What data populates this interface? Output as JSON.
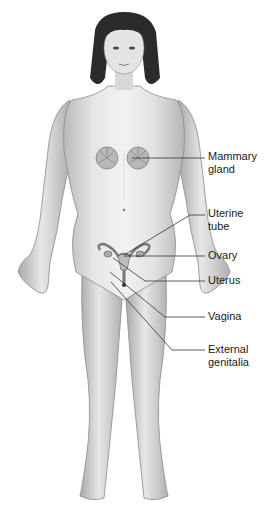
{
  "figure": {
    "colors": {
      "skin_light": "#ededed",
      "skin_mid": "#c9c9c9",
      "skin_dark": "#8a8a8a",
      "hair": "#2b2b2b",
      "organ": "#9a9a9a",
      "leader_line": "#333333",
      "text": "#1a1a1a",
      "background": "#ffffff"
    }
  },
  "labels": [
    {
      "id": "mammary-gland",
      "text": "Mammary\ngland",
      "top": 150,
      "line_y": 158,
      "target_x": 132,
      "target_y": 158
    },
    {
      "id": "uterine-tube",
      "text": "Uterine\ntube",
      "top": 207,
      "line_y": 215,
      "target_x": 122,
      "target_y": 255
    },
    {
      "id": "ovary",
      "text": "Ovary",
      "top": 248,
      "line_y": 256,
      "target_x": 124,
      "target_y": 256
    },
    {
      "id": "uterus",
      "text": "Uterus",
      "top": 274,
      "line_y": 281,
      "target_x": 113,
      "target_y": 258
    },
    {
      "id": "vagina",
      "text": "Vagina",
      "top": 309,
      "line_y": 317,
      "target_x": 110,
      "target_y": 272
    },
    {
      "id": "external-genitalia",
      "text": "External\ngenitalia",
      "top": 343,
      "line_y": 350,
      "target_x": 111,
      "target_y": 282
    }
  ]
}
